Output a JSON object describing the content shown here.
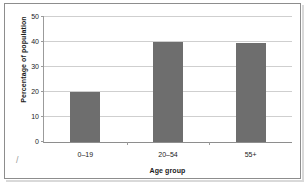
{
  "chart_data": {
    "type": "bar",
    "title": "",
    "subtitle": "",
    "categories": [
      "0–19",
      "20–54",
      "55+"
    ],
    "values": [
      20,
      40,
      39.5
    ],
    "series": [
      {
        "name": "Percentage of population",
        "values": [
          20,
          40,
          39.5
        ]
      }
    ],
    "xlabel": "Age group",
    "ylabel": "Percentage of population",
    "ylim": [
      0,
      50
    ],
    "ytick_labels": [
      "0",
      "10",
      "20",
      "30",
      "40",
      "50"
    ],
    "ytick_values": [
      0,
      10,
      20,
      30,
      40,
      50
    ],
    "grid": "horizontal",
    "legend": "none",
    "bar_color": "#6e6e6e",
    "gridline_color": "#cfcfcf",
    "axis_color": "#9b9b9b",
    "plot_background": "#ffffff",
    "frame_color": "#8d8d8d",
    "annotations": []
  }
}
